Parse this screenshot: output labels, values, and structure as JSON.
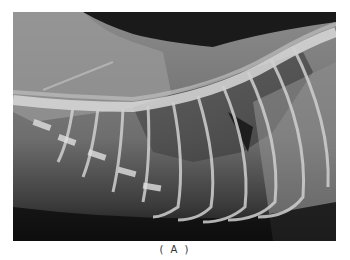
{
  "figure": {
    "image_alt": "Lateral thoracic radiograph showing spine, ribs and lung fields",
    "caption": "( A )"
  }
}
